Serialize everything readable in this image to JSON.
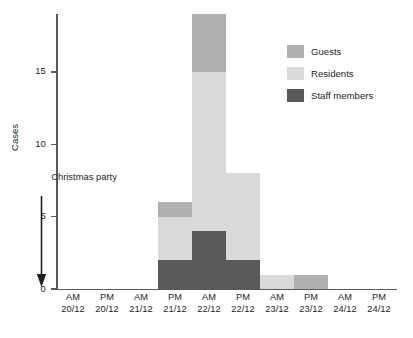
{
  "chart_data": {
    "type": "bar",
    "stacked": true,
    "title": "",
    "subtitle": "",
    "xlabel": "",
    "ylabel": "Cases",
    "ylim": [
      0,
      19
    ],
    "yticks": [
      0,
      5,
      10,
      15
    ],
    "ytick_labels": [
      "0",
      "5",
      "10",
      "15"
    ],
    "grid": false,
    "legend_position": "top-right",
    "categories": [
      "AM 20/12",
      "PM 20/12",
      "AM 21/12",
      "PM 21/12",
      "AM 22/12",
      "PM 22/12",
      "AM 23/12",
      "PM 23/12",
      "AM 24/12",
      "PM 24/12"
    ],
    "category_lines": [
      {
        "line1": "AM",
        "line2": "20/12"
      },
      {
        "line1": "PM",
        "line2": "20/12"
      },
      {
        "line1": "AM",
        "line2": "21/12"
      },
      {
        "line1": "PM",
        "line2": "21/12"
      },
      {
        "line1": "AM",
        "line2": "22/12"
      },
      {
        "line1": "PM",
        "line2": "22/12"
      },
      {
        "line1": "AM",
        "line2": "23/12"
      },
      {
        "line1": "PM",
        "line2": "23/12"
      },
      {
        "line1": "AM",
        "line2": "24/12"
      },
      {
        "line1": "PM",
        "line2": "24/12"
      }
    ],
    "series": [
      {
        "name": "Staff members",
        "color": "#58595b",
        "values": [
          0,
          0,
          0,
          2,
          4,
          2,
          0,
          0,
          0,
          0
        ]
      },
      {
        "name": "Residents",
        "color": "#d9d9d9",
        "values": [
          0,
          0,
          0,
          3,
          11,
          6,
          1,
          0,
          0,
          0
        ]
      },
      {
        "name": "Guests",
        "color": "#b0b0b0",
        "values": [
          0,
          0,
          0,
          1,
          4,
          0,
          0,
          1,
          0,
          0
        ]
      }
    ],
    "stack_order_bottom_to_top": [
      "Staff members",
      "Residents",
      "Guests"
    ],
    "totals": [
      0,
      0,
      0,
      6,
      19,
      8,
      1,
      1,
      0,
      0
    ],
    "annotations": [
      {
        "text_line1": "Christmas",
        "text_line2": "party",
        "target_category": "PM 20/12",
        "marker": "down-arrow"
      }
    ]
  },
  "legend": {
    "items": [
      {
        "label": "Guests",
        "color": "#b0b0b0"
      },
      {
        "label": "Residents",
        "color": "#d9d9d9"
      },
      {
        "label": "Staff members",
        "color": "#58595b"
      }
    ]
  },
  "axis": {
    "y_title": "Cases",
    "axis_color": "#58595b"
  },
  "annotation": {
    "line1": "Christmas",
    "line2": "party"
  }
}
